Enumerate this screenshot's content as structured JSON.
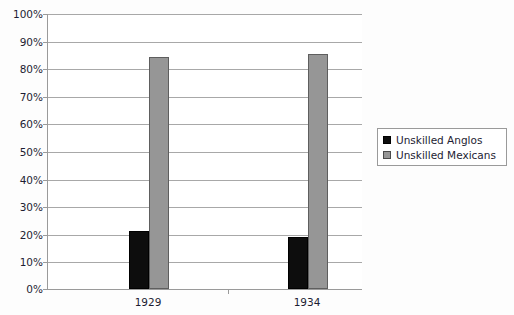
{
  "chart_data": {
    "type": "bar",
    "title": "",
    "subtitle": "",
    "xlabel": "",
    "ylabel": "",
    "categories": [
      "1929",
      "1934"
    ],
    "series": [
      {
        "name": "Unskilled Anglos",
        "color": "#0d0d0d",
        "values": [
          21,
          19
        ]
      },
      {
        "name": "Unskilled Mexicans",
        "color": "#969696",
        "values": [
          84,
          85
        ]
      }
    ],
    "ylim": [
      0,
      100
    ],
    "ytick_step": 10,
    "ytick_labels": [
      "0%",
      "10%",
      "20%",
      "30%",
      "40%",
      "50%",
      "60%",
      "70%",
      "80%",
      "90%",
      "100%"
    ],
    "ytick_values": [
      0,
      10,
      20,
      30,
      40,
      50,
      60,
      70,
      80,
      90,
      100
    ],
    "value_suffix": "%",
    "grid": true,
    "grid_axis": "y",
    "legend_position": "right",
    "legend_entries": [
      "Unskilled Anglos",
      "Unskilled Mexicans"
    ]
  },
  "colors": {
    "anglos": "#0d0d0d",
    "mexicans": "#969696",
    "gridline": "#a8a8a8",
    "axis": "#9a9a9a",
    "text": "#1d1d33",
    "plot_background": "#ffffff"
  }
}
